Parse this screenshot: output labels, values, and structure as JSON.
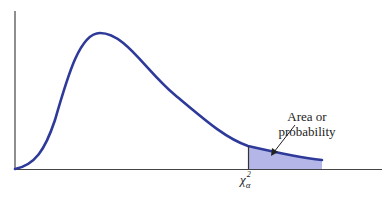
{
  "diagram": {
    "type": "chi-square distribution density curve with right-tail shaded area",
    "annotation": {
      "line1": "Area or",
      "line2": "probability"
    },
    "critical_value": {
      "symbol": "χ",
      "superscript": "2",
      "subscript": "α"
    },
    "colors": {
      "curve": "#2e3a9a",
      "fill": "#b3b6e6",
      "axis": "#444444",
      "arrow": "#222222"
    }
  }
}
